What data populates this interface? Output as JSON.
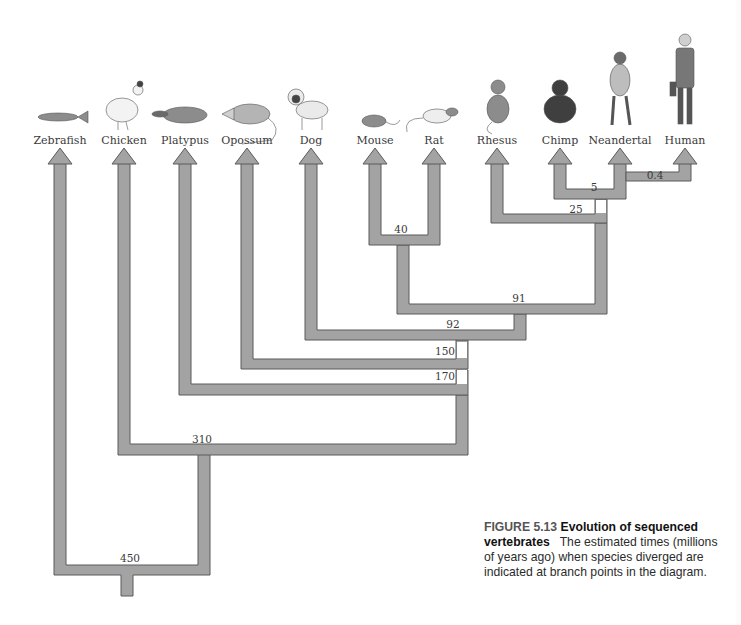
{
  "figure": {
    "number": "FIGURE 5.13",
    "title": "Evolution of sequenced vertebrates",
    "description": "The estimated times (millions of years ago) when species diverged are indicated at branch points in the diagram."
  },
  "species": [
    {
      "name": "Zebrafish",
      "icon": "zebrafish-icon",
      "x": 60
    },
    {
      "name": "Chicken",
      "icon": "chicken-icon",
      "x": 124
    },
    {
      "name": "Platypus",
      "icon": "platypus-icon",
      "x": 185
    },
    {
      "name": "Opossum",
      "icon": "opossum-icon",
      "x": 247
    },
    {
      "name": "Dog",
      "icon": "dog-icon",
      "x": 311
    },
    {
      "name": "Mouse",
      "icon": "mouse-icon",
      "x": 375
    },
    {
      "name": "Rat",
      "icon": "rat-icon",
      "x": 434
    },
    {
      "name": "Rhesus",
      "icon": "rhesus-monkey-icon",
      "x": 497
    },
    {
      "name": "Chimp",
      "icon": "chimpanzee-icon",
      "x": 560
    },
    {
      "name": "Neandertal",
      "icon": "neandertal-icon",
      "x": 620
    },
    {
      "name": "Human",
      "icon": "human-icon",
      "x": 685
    }
  ],
  "divergence_nodes": [
    {
      "label": "0.4",
      "clade": [
        "Neandertal",
        "Human"
      ],
      "x": 655,
      "y": 170
    },
    {
      "label": "5",
      "clade": [
        "Chimp",
        "Neandertal",
        "Human"
      ],
      "x": 566,
      "y": 184
    },
    {
      "label": "25",
      "clade": [
        "Rhesus",
        "Chimp",
        "Neandertal",
        "Human"
      ],
      "x": 576,
      "y": 207
    },
    {
      "label": "40",
      "clade": [
        "Mouse",
        "Rat"
      ],
      "x": 401,
      "y": 222
    },
    {
      "label": "91",
      "clade": [
        "Mouse",
        "Rat",
        "Rhesus",
        "Chimp",
        "Neandertal",
        "Human"
      ],
      "x": 519,
      "y": 292
    },
    {
      "label": "92",
      "clade": [
        "Dog",
        "Mouse",
        "Rat",
        "Rhesus",
        "Chimp",
        "Neandertal",
        "Human"
      ],
      "x": 453,
      "y": 319
    },
    {
      "label": "150",
      "clade": [
        "Opossum",
        "Dog",
        "Mouse",
        "Rat",
        "Rhesus",
        "Chimp",
        "Neandertal",
        "Human"
      ],
      "x": 445,
      "y": 346
    },
    {
      "label": "170",
      "clade": [
        "Platypus",
        "Opossum",
        "Dog",
        "Mouse",
        "Rat",
        "Rhesus",
        "Chimp",
        "Neandertal",
        "Human"
      ],
      "x": 445,
      "y": 371
    },
    {
      "label": "310",
      "clade": [
        "Chicken",
        "Platypus",
        "Opossum",
        "Dog",
        "Mouse",
        "Rat",
        "Rhesus",
        "Chimp",
        "Neandertal",
        "Human"
      ],
      "x": 201,
      "y": 432
    },
    {
      "label": "450",
      "clade": [
        "Zebrafish",
        "Chicken",
        "Platypus",
        "Opossum",
        "Dog",
        "Mouse",
        "Rat",
        "Rhesus",
        "Chimp",
        "Neandertal",
        "Human"
      ],
      "x": 130,
      "y": 551
    }
  ],
  "colors": {
    "branch_fill": "#a3a3a3",
    "branch_stroke": "#5a5a5a",
    "text": "#3a3a3a"
  }
}
